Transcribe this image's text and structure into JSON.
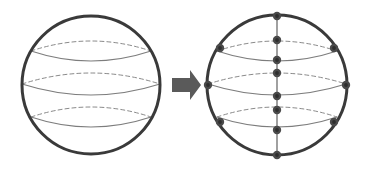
{
  "figure": {
    "background_color": "#ffffff",
    "width": 367,
    "height": 171
  },
  "colors": {
    "sphere_outline": "#3a3a3a",
    "latitude_front": "#7d7d7d",
    "latitude_back": "#8a8a8a",
    "meridian": "#6e6e6e",
    "node_fill": "#4a4a4a",
    "node_core": "#2e2e2e",
    "arrow_fill": "#5a5a5a",
    "arrow_stroke": "#3a3a3a",
    "background": "#ffffff"
  },
  "strokes": {
    "sphere_outline_width": 3.0,
    "latitude_front_width": 1.1,
    "latitude_back_width": 1.0,
    "latitude_back_dash": "4 3",
    "meridian_width": 1.3,
    "node_radius": 4.2,
    "node_core_radius": 1.9
  },
  "left_sphere": {
    "label": "continuous-sphere",
    "center_x": 91,
    "center_y": 85,
    "radius": 69,
    "latitudes": [
      {
        "name": "upper-latitude",
        "y": 51,
        "half_width": 60,
        "front_sag": 10,
        "back_sag": 10
      },
      {
        "name": "equator-latitude",
        "y": 84,
        "half_width": 69,
        "front_sag": 11,
        "back_sag": 11
      },
      {
        "name": "lower-latitude",
        "y": 117,
        "half_width": 60,
        "front_sag": 10,
        "back_sag": 10
      }
    ]
  },
  "right_sphere": {
    "label": "discretized-sphere",
    "center_x": 277,
    "center_y": 85,
    "radius": 70,
    "latitudes": [
      {
        "name": "upper-latitude",
        "y": 51,
        "half_width": 60,
        "front_sag": 10,
        "back_sag": 10
      },
      {
        "name": "equator-latitude",
        "y": 84,
        "half_width": 69,
        "front_sag": 11,
        "back_sag": 11
      },
      {
        "name": "lower-latitude",
        "y": 117,
        "half_width": 60,
        "front_sag": 10,
        "back_sag": 10
      }
    ],
    "meridian": {
      "name": "vertical-meridian",
      "x": 277,
      "y_top": 16,
      "y_bottom": 155
    },
    "nodes": [
      {
        "name": "node-north-pole",
        "x": 277,
        "y": 16
      },
      {
        "name": "node-meridian-upper-back",
        "x": 277,
        "y": 40
      },
      {
        "name": "node-meridian-upper-front",
        "x": 277,
        "y": 60
      },
      {
        "name": "node-meridian-equator-back",
        "x": 277,
        "y": 73
      },
      {
        "name": "node-meridian-equator-front",
        "x": 277,
        "y": 96
      },
      {
        "name": "node-meridian-lower-back",
        "x": 277,
        "y": 110
      },
      {
        "name": "node-meridian-lower-front",
        "x": 277,
        "y": 130
      },
      {
        "name": "node-south-pole",
        "x": 277,
        "y": 155
      },
      {
        "name": "node-upper-left",
        "x": 220,
        "y": 48
      },
      {
        "name": "node-upper-right",
        "x": 334,
        "y": 48
      },
      {
        "name": "node-equator-left",
        "x": 208,
        "y": 85
      },
      {
        "name": "node-equator-right",
        "x": 346,
        "y": 85
      },
      {
        "name": "node-lower-left",
        "x": 220,
        "y": 122
      },
      {
        "name": "node-lower-right",
        "x": 334,
        "y": 122
      }
    ],
    "node_count": 14
  },
  "arrow": {
    "name": "transform-arrow",
    "direction": "right",
    "shaft_x": 172,
    "shaft_y": 78,
    "shaft_width": 18,
    "shaft_height": 14,
    "tip_x": 201,
    "head_top_y": 70,
    "head_bottom_y": 100
  },
  "chart_data": {
    "type": "diagram",
    "stages": [
      {
        "name": "continuous-sphere",
        "description": "Smooth sphere with three latitude circles (upper, equator, lower); front halves solid, back halves dashed",
        "latitude_count": 3,
        "node_count": 0
      },
      {
        "name": "discretized-sphere",
        "description": "Same sphere with a vertical meridian and discrete mesh nodes at latitude/meridian intersections and at the poles",
        "latitude_count": 3,
        "meridian_count": 1,
        "node_count": 14
      }
    ],
    "relation": "arrow pointing right from continuous sphere to discretized sphere"
  }
}
